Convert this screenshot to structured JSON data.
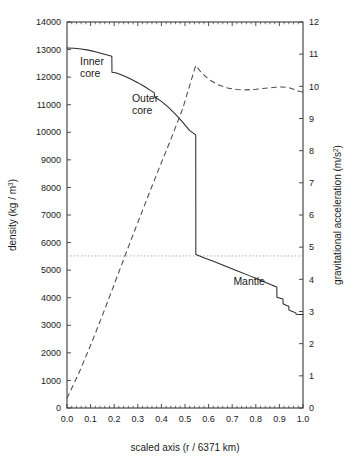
{
  "chart_data": {
    "type": "line",
    "title": "",
    "subtitle": "",
    "xlabel": "scaled axis (r / 6371 km)",
    "xlabel_parts": {
      "prefix": "scaled axis (r / 6371 km)"
    },
    "ylabel": "density (kg / m3)",
    "ylabel_parts": {
      "main": "density (kg / m",
      "sup": "3",
      "suffix": ")"
    },
    "y2label": "gravitational acceleration (m/s2)",
    "y2label_parts": {
      "main": "gravitational acceleration (m/s",
      "sup": "2",
      "suffix": ")"
    },
    "xlim": [
      0.0,
      1.0
    ],
    "ylim": [
      0,
      14000
    ],
    "y2lim": [
      0,
      12
    ],
    "grid": false,
    "legend_position": "none",
    "xticks": [
      "0.0",
      "0.1",
      "0.2",
      "0.3",
      "0.4",
      "0.5",
      "0.6",
      "0.7",
      "0.8",
      "0.9",
      "1.0"
    ],
    "xtick_values": [
      0.0,
      0.1,
      0.2,
      0.3,
      0.4,
      0.5,
      0.6,
      0.7,
      0.8,
      0.9,
      1.0
    ],
    "yticks": [
      "0",
      "1000",
      "2000",
      "3000",
      "4000",
      "5000",
      "6000",
      "7000",
      "8000",
      "9000",
      "10000",
      "11000",
      "12000",
      "13000",
      "14000"
    ],
    "ytick_values": [
      0,
      1000,
      2000,
      3000,
      4000,
      5000,
      6000,
      7000,
      8000,
      9000,
      10000,
      11000,
      12000,
      13000,
      14000
    ],
    "y2ticks": [
      "0",
      "1",
      "2",
      "3",
      "4",
      "5",
      "6",
      "7",
      "8",
      "9",
      "10",
      "11",
      "12"
    ],
    "y2tick_values": [
      0,
      1,
      2,
      3,
      4,
      5,
      6,
      7,
      8,
      9,
      10,
      11,
      12
    ],
    "annotations": [
      {
        "text": "Inner core",
        "line1": "Inner",
        "line2": "core",
        "x": 0.055,
        "y": 12450
      },
      {
        "text": "Outer core",
        "line1": "Outer",
        "line2": "core",
        "x": 0.275,
        "y": 11100
      },
      {
        "text": "Mantle",
        "line1": "Mantle",
        "line2": "",
        "x": 0.705,
        "y": 4450
      }
    ],
    "reference_line": {
      "label": "mean Earth density",
      "y": 5515,
      "axis": "left",
      "style": "dotted"
    },
    "series": [
      {
        "name": "density",
        "axis": "left",
        "style": "solid",
        "unit": "kg / m^3",
        "x": [
          0.0,
          0.03,
          0.06,
          0.09,
          0.12,
          0.15,
          0.175,
          0.19,
          0.1905,
          0.21,
          0.24,
          0.27,
          0.3,
          0.33,
          0.355,
          0.37,
          0.3705,
          0.4,
          0.43,
          0.46,
          0.49,
          0.52,
          0.5455,
          0.546,
          0.58,
          0.62,
          0.67,
          0.72,
          0.77,
          0.82,
          0.865,
          0.889,
          0.8895,
          0.9,
          0.915,
          0.9155,
          0.93,
          0.94,
          0.9405,
          0.955,
          0.97,
          0.9705,
          0.985,
          1.0
        ],
        "y": [
          13060,
          13050,
          13020,
          12980,
          12920,
          12850,
          12790,
          12760,
          12180,
          12150,
          12050,
          11930,
          11800,
          11650,
          11510,
          11430,
          11290,
          11120,
          10900,
          10650,
          10370,
          10060,
          9905,
          5570,
          5450,
          5320,
          5150,
          4980,
          4810,
          4630,
          4470,
          4390,
          4020,
          3990,
          3950,
          3780,
          3720,
          3690,
          3550,
          3500,
          3450,
          3400,
          3390,
          3390
        ]
      },
      {
        "name": "gravitational acceleration",
        "axis": "right",
        "style": "dashed",
        "unit": "m/s^2",
        "x": [
          0.0,
          0.05,
          0.1,
          0.15,
          0.19,
          0.24,
          0.29,
          0.34,
          0.39,
          0.44,
          0.49,
          0.5455,
          0.57,
          0.6,
          0.64,
          0.68,
          0.72,
          0.76,
          0.8,
          0.84,
          0.88,
          0.91,
          0.94,
          0.965,
          0.985,
          1.0
        ],
        "y": [
          0.3,
          1.08,
          1.95,
          2.88,
          3.65,
          4.62,
          5.58,
          6.52,
          7.45,
          8.35,
          9.3,
          10.65,
          10.42,
          10.22,
          10.05,
          9.95,
          9.9,
          9.89,
          9.91,
          9.94,
          9.97,
          9.98,
          9.96,
          9.9,
          9.84,
          9.82
        ]
      }
    ]
  },
  "layout": {
    "plot_left": 67,
    "plot_right": 303,
    "plot_top": 22,
    "plot_bottom": 408
  }
}
